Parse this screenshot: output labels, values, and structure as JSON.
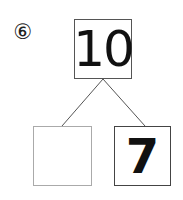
{
  "problem": {
    "number_label": "⑥"
  },
  "number_bond": {
    "whole": "10",
    "part_left": "",
    "part_right": "7"
  },
  "colors": {
    "line": "#555555",
    "top_border": "#555555",
    "left_border": "#aaaaaa",
    "right_border": "#444444"
  }
}
